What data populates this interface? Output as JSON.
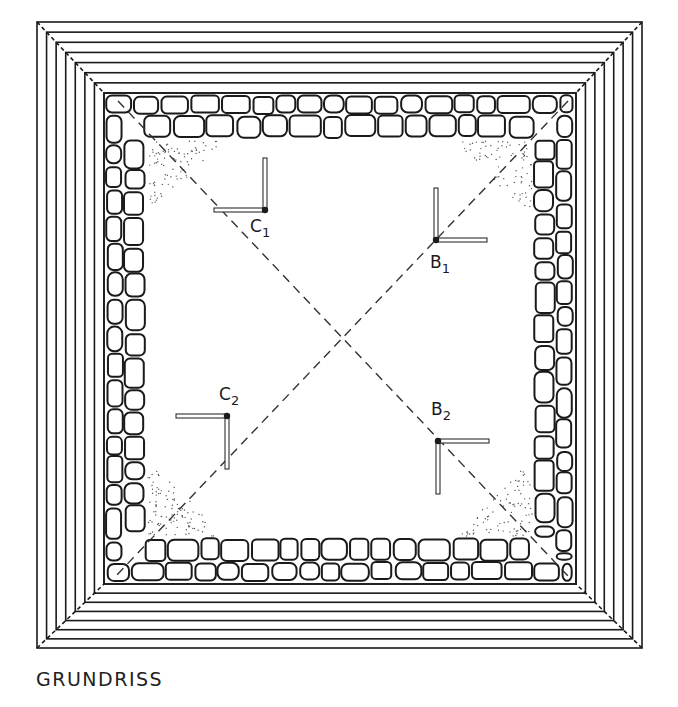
{
  "caption": "GRUNDRISS",
  "colors": {
    "ink": "#1a1a1a",
    "paper": "#ffffff",
    "stipple": "#555555"
  },
  "frame": {
    "outer": [
      37,
      22,
      642,
      648
    ],
    "step_count": 7,
    "inner_wall_box": [
      104,
      93,
      576,
      584
    ]
  },
  "diagonals": {
    "style": "dashed",
    "center": [
      341,
      338
    ]
  },
  "markers": [
    {
      "id": "C1",
      "letter": "C",
      "sub": "1",
      "dot": [
        265,
        210
      ],
      "arm_vertical": "up",
      "arm_horizontal": "left",
      "label_pos": [
        250,
        218
      ]
    },
    {
      "id": "B1",
      "letter": "B",
      "sub": "1",
      "dot": [
        436,
        240
      ],
      "arm_vertical": "up",
      "arm_horizontal": "right",
      "label_pos": [
        430,
        254
      ]
    },
    {
      "id": "C2",
      "letter": "C",
      "sub": "2",
      "dot": [
        227,
        416
      ],
      "arm_vertical": "down",
      "arm_horizontal": "left",
      "label_pos": [
        219,
        386
      ]
    },
    {
      "id": "B2",
      "letter": "B",
      "sub": "2",
      "dot": [
        438,
        441
      ],
      "arm_vertical": "down",
      "arm_horizontal": "right",
      "label_pos": [
        431,
        401
      ]
    }
  ]
}
